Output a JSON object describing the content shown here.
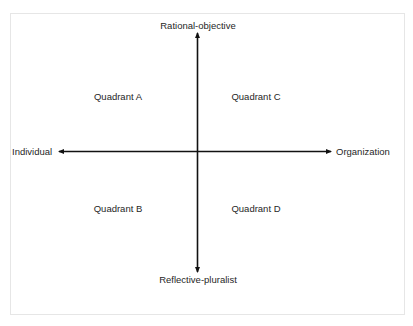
{
  "diagram": {
    "type": "quadrant-matrix",
    "axes": {
      "vertical": {
        "top_label": "Rational-objective",
        "bottom_label": "Reflective-pluralist"
      },
      "horizontal": {
        "left_label": "Individual",
        "right_label": "Organization"
      }
    },
    "quadrants": {
      "top_left": "Quadrant A",
      "bottom_left": "Quadrant B",
      "top_right": "Quadrant C",
      "bottom_right": "Quadrant D"
    },
    "colors": {
      "axis": "#111111",
      "frame_border": "#e6e6e6",
      "text": "#262626"
    }
  }
}
